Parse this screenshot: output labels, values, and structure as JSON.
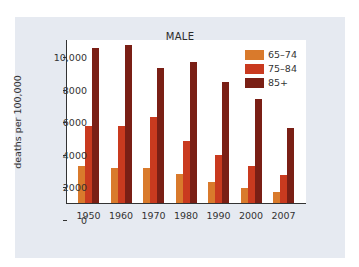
{
  "chart_data": {
    "type": "bar",
    "title": "MALE",
    "xlabel": "",
    "ylabel": "deaths per 100,000",
    "ylim": [
      0,
      10000
    ],
    "yticks": [
      0,
      2000,
      4000,
      6000,
      8000,
      10000
    ],
    "ytick_labels": [
      "0",
      "2000",
      "4000",
      "6000",
      "8000",
      "10,000"
    ],
    "categories": [
      "1950",
      "1960",
      "1970",
      "1980",
      "1990",
      "2000",
      "2007"
    ],
    "series": [
      {
        "name": "65–74",
        "color": "#d97a2c",
        "values": [
          2250,
          2150,
          2150,
          1780,
          1290,
          920,
          680
        ]
      },
      {
        "name": "75–84",
        "color": "#c93a1f",
        "values": [
          4700,
          4700,
          5300,
          3800,
          2950,
          2300,
          1700
        ]
      },
      {
        "name": "85+",
        "color": "#7a1f15",
        "values": [
          9500,
          9700,
          8300,
          8650,
          7400,
          6400,
          4600
        ]
      }
    ],
    "legend_position": "top-right",
    "grid": false
  },
  "chart": {
    "title": "MALE",
    "ylabel": "deaths per 100,000",
    "legend": [
      "65–74",
      "75–84",
      "85+"
    ]
  }
}
